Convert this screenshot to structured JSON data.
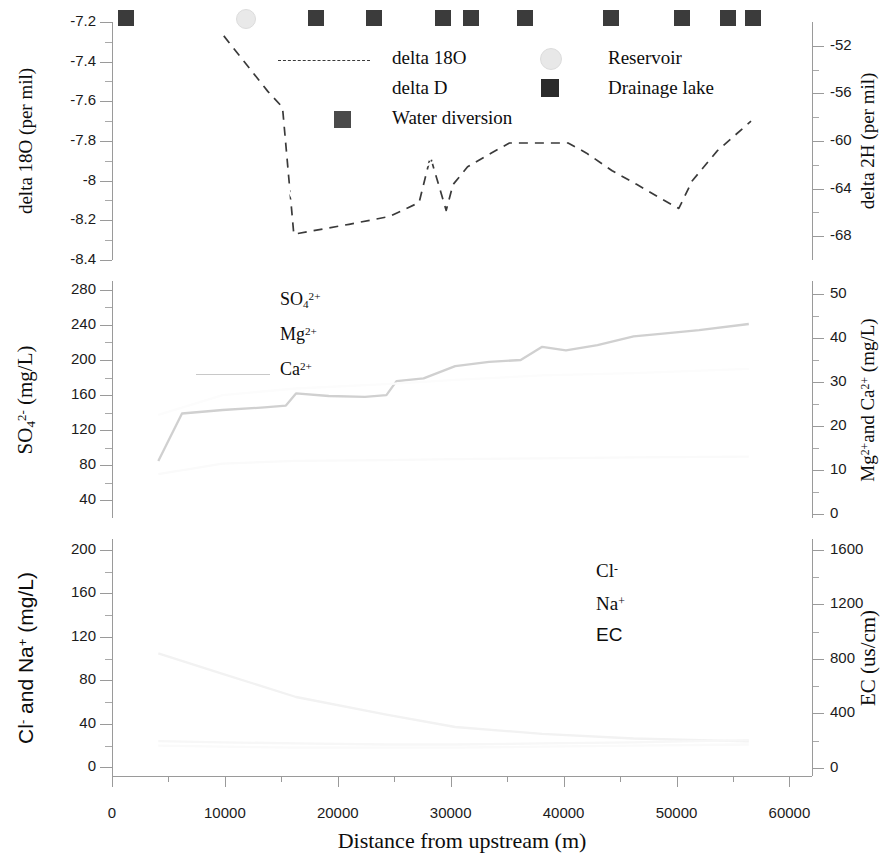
{
  "figure": {
    "xaxis": {
      "title": "Distance from upstream (m)",
      "ticks": [
        "0",
        "10000",
        "20000",
        "30000",
        "40000",
        "50000",
        "60000"
      ],
      "min": 0,
      "max": 62000,
      "tick_values": [
        0,
        10000,
        20000,
        30000,
        40000,
        50000,
        60000
      ]
    }
  },
  "panel_top": {
    "left_axis": {
      "title_parts": {
        "pre": "delta 18O (per mil)"
      },
      "ticks": [
        "-7.2",
        "-7.4",
        "-7.6",
        "-7.8",
        "-8",
        "-8.2",
        "-8.4"
      ],
      "tick_values": [
        -7.2,
        -7.4,
        -7.6,
        -7.8,
        -8.0,
        -8.2,
        -8.4
      ],
      "min": -8.4,
      "max": -7.2
    },
    "right_axis": {
      "title": "delta 2H (per mil)",
      "ticks": [
        "-52",
        "-56",
        "-60",
        "-64",
        "-68"
      ],
      "tick_values": [
        -52,
        -56,
        -60,
        -64,
        -68
      ],
      "min": -70,
      "max": -50
    },
    "legend": [
      {
        "label": "delta 18O",
        "marker": "dashed-line",
        "color": "#3a3a3a"
      },
      {
        "label": "delta D",
        "marker": "none",
        "color": "#ffffff"
      },
      {
        "label": "Water diversion",
        "marker": "square",
        "color": "#4a4a4a"
      },
      {
        "label": "Reservoir",
        "marker": "circle",
        "color": "#e8e8e8"
      },
      {
        "label": "Drainage lake",
        "marker": "square",
        "color": "#2b2b2b"
      }
    ]
  },
  "panel_mid": {
    "left_axis": {
      "title": "SO4 2- (mg/L)",
      "ticks": [
        "280",
        "240",
        "200",
        "160",
        "120",
        "80",
        "40"
      ],
      "tick_values": [
        280,
        240,
        200,
        160,
        120,
        80,
        40
      ],
      "min": 20,
      "max": 290
    },
    "right_axis": {
      "title": "Mg2+ and Ca2+ (mg/L)",
      "ticks": [
        "50",
        "40",
        "30",
        "20",
        "10",
        "0"
      ],
      "tick_values": [
        50,
        40,
        30,
        20,
        10,
        0
      ],
      "min": -1,
      "max": 53
    },
    "legend": [
      {
        "label": "SO4 2+",
        "marker": "none",
        "color": "#ffffff"
      },
      {
        "label": "Mg 2+",
        "marker": "none",
        "color": "#ffffff"
      },
      {
        "label": "Ca 2+",
        "marker": "solid-line",
        "color": "#c8c8c8"
      }
    ]
  },
  "panel_bot": {
    "left_axis": {
      "title": "Cl- and Na+ (mg/L)",
      "ticks": [
        "200",
        "160",
        "120",
        "80",
        "40",
        "0"
      ],
      "tick_values": [
        200,
        160,
        120,
        80,
        40,
        0
      ],
      "min": -8,
      "max": 210
    },
    "right_axis": {
      "title": "EC (us/cm)",
      "ticks": [
        "1600",
        "1200",
        "800",
        "400",
        "0"
      ],
      "tick_values": [
        1600,
        1200,
        800,
        400,
        0
      ],
      "min": -60,
      "max": 1680
    },
    "legend": [
      {
        "label": "Cl-",
        "marker": "none",
        "color": "#ffffff"
      },
      {
        "label": "Na+",
        "marker": "none",
        "color": "#ffffff"
      },
      {
        "label": "EC",
        "marker": "none",
        "color": "#ffffff"
      }
    ]
  },
  "site_markers": [
    {
      "x": 1200,
      "type": "drainage-lake"
    },
    {
      "x": 11800,
      "type": "reservoir"
    },
    {
      "x": 18100,
      "type": "drainage-lake"
    },
    {
      "x": 23200,
      "type": "drainage-lake"
    },
    {
      "x": 29300,
      "type": "drainage-lake"
    },
    {
      "x": 31800,
      "type": "drainage-lake"
    },
    {
      "x": 36600,
      "type": "drainage-lake"
    },
    {
      "x": 44200,
      "type": "drainage-lake"
    },
    {
      "x": 50500,
      "type": "drainage-lake"
    },
    {
      "x": 54600,
      "type": "drainage-lake"
    },
    {
      "x": 56800,
      "type": "drainage-lake"
    }
  ],
  "chart_data": [
    {
      "type": "line",
      "panel": "top",
      "title": "",
      "xlabel": "Distance from upstream (m)",
      "ylabel": "delta 18O (per mil)",
      "ylabel_right": "delta 2H (per mil)",
      "xlim": [
        0,
        62000
      ],
      "ylim": [
        -8.4,
        -7.2
      ],
      "ylim_right": [
        -70,
        -50
      ],
      "grid": false,
      "legend_position": "upper-center",
      "series": [
        {
          "name": "delta 18O",
          "style": "dashed",
          "color": "#3a3a3a",
          "axis": "left",
          "x": [
            9900,
            13800,
            15100,
            16100,
            21000,
            24600,
            27200,
            28200,
            29600,
            30200,
            31500,
            33600,
            35200,
            37500,
            40400,
            42000,
            44300,
            46500,
            48600,
            50200,
            51400,
            53600,
            56600
          ],
          "y": [
            -7.27,
            -7.55,
            -7.63,
            -8.27,
            -8.22,
            -8.18,
            -8.11,
            -7.88,
            -8.15,
            -8.02,
            -7.93,
            -7.86,
            -7.81,
            -7.81,
            -7.81,
            -7.86,
            -7.95,
            -8.02,
            -8.09,
            -8.14,
            -8.0,
            -7.85,
            -7.7
          ]
        },
        {
          "name": "delta D",
          "style": "solid",
          "color": "#ffffff",
          "axis": "right",
          "x": [
            9900,
            16100,
            24600,
            30200,
            37500,
            44300,
            50200,
            56600
          ],
          "y": [
            -53.5,
            -65.0,
            -63.5,
            -61.0,
            -59.5,
            -60.5,
            -64.0,
            -57.5
          ]
        }
      ]
    },
    {
      "type": "line",
      "panel": "middle",
      "title": "",
      "xlabel": "",
      "ylabel": "SO4 2- (mg/L)",
      "ylabel_right": "Mg2+ and Ca2+ (mg/L)",
      "xlim": [
        0,
        62000
      ],
      "ylim": [
        20,
        290
      ],
      "ylim_right": [
        -1,
        53
      ],
      "grid": false,
      "legend_position": "upper-center",
      "series": [
        {
          "name": "SO4 2-",
          "style": "solid",
          "color": "#d0d0d0",
          "axis": "left",
          "x": [
            4100,
            6200,
            9800,
            13500,
            15400,
            16300,
            19200,
            22400,
            24300,
            25200,
            27600,
            30400,
            33400,
            36200,
            38100,
            40200,
            43000,
            46200,
            48800,
            52000,
            56400
          ],
          "y": [
            85,
            139,
            143,
            146,
            148,
            162,
            159,
            158,
            160,
            176,
            179,
            193,
            198,
            200,
            215,
            211,
            217,
            227,
            230,
            234,
            241
          ]
        },
        {
          "name": "Mg 2+",
          "style": "solid",
          "color": "#fafafa",
          "axis": "right",
          "x": [
            4100,
            9800,
            16300,
            24300,
            30400,
            38100,
            46200,
            56400
          ],
          "y": [
            9.0,
            11.4,
            12.0,
            12.2,
            12.4,
            12.6,
            12.8,
            13.0
          ]
        },
        {
          "name": "Ca 2+",
          "style": "solid",
          "color": "#fcfcfc",
          "axis": "right",
          "x": [
            4100,
            9800,
            16300,
            24300,
            30400,
            38100,
            46200,
            56400
          ],
          "y": [
            22.5,
            27.0,
            28.5,
            29.5,
            30.5,
            31.5,
            32.0,
            33.0
          ]
        }
      ]
    },
    {
      "type": "line",
      "panel": "bottom",
      "title": "",
      "xlabel": "Distance from upstream (m)",
      "ylabel": "Cl- and Na+ (mg/L)",
      "ylabel_right": "EC (us/cm)",
      "xlim": [
        0,
        62000
      ],
      "ylim": [
        -8,
        210
      ],
      "ylim_right": [
        -60,
        1680
      ],
      "grid": false,
      "legend_position": "center-right",
      "series": [
        {
          "name": "EC",
          "style": "solid",
          "color": "#f2f2f2",
          "axis": "right",
          "x": [
            4100,
            9800,
            16300,
            24300,
            30400,
            38100,
            46200,
            56400
          ],
          "y": [
            840,
            690,
            520,
            390,
            300,
            250,
            215,
            195
          ]
        },
        {
          "name": "Cl-",
          "style": "solid",
          "color": "#f7f7f7",
          "axis": "left",
          "x": [
            4100,
            9800,
            16300,
            24300,
            30400,
            38100,
            46200,
            56400
          ],
          "y": [
            24,
            23,
            22,
            21,
            21,
            22,
            23,
            25
          ]
        },
        {
          "name": "Na+",
          "style": "solid",
          "color": "#fafafa",
          "axis": "left",
          "x": [
            4100,
            9800,
            16300,
            24300,
            30400,
            38100,
            46200,
            56400
          ],
          "y": [
            20,
            19,
            18,
            18,
            18,
            19,
            20,
            21
          ]
        }
      ]
    }
  ]
}
